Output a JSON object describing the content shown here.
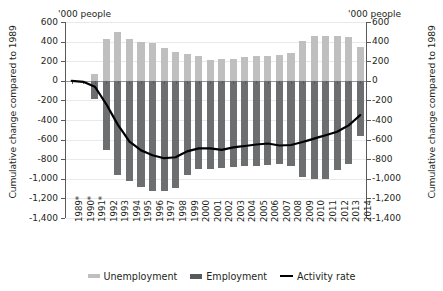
{
  "axes": {
    "ylabel_left": "Cumulative change compared to 1989",
    "ylabel_right": "Cumulative change compared to 1989",
    "units_left": "'000 people",
    "units_right": "'000 people"
  },
  "legend": {
    "items": [
      {
        "label": "Unemployment",
        "color": "#bfbfbf",
        "marker": "swatch-unemployment"
      },
      {
        "label": "Employment",
        "color": "#58595b",
        "marker": "swatch-employment"
      },
      {
        "label": "Activity rate",
        "color": "#000000",
        "marker": "swatch-activity-line"
      }
    ]
  },
  "chart_data": {
    "type": "bar",
    "title": "",
    "subtitle": "",
    "xlabel": "",
    "ylabel": "Cumulative change compared to 1989",
    "units": "'000 people",
    "ylim": [
      -1400,
      600
    ],
    "ytick_labels": [
      "600",
      "400",
      "200",
      "0",
      "-200",
      "-400",
      "-600",
      "-800",
      "-1,000",
      "-1,200",
      "-1,400"
    ],
    "ytick_values": [
      600,
      400,
      200,
      0,
      -200,
      -400,
      -600,
      -800,
      -1000,
      -1200,
      -1400
    ],
    "grid": true,
    "legend_position": "bottom",
    "dual_axis": true,
    "categories": [
      "1989*",
      "1990*",
      "1991*",
      "1992",
      "1993",
      "1994",
      "1995",
      "1996",
      "1997",
      "1998",
      "1999",
      "2000",
      "2001",
      "2002",
      "2003",
      "2004",
      "2005",
      "2006",
      "2007",
      "2008",
      "2009",
      "2010",
      "2011",
      "2012",
      "2013",
      "2014"
    ],
    "series": [
      {
        "name": "Unemployment",
        "color": "#bfbfbf",
        "type": "bar",
        "values": [
          0,
          0,
          70,
          425,
          500,
          430,
          395,
          385,
          330,
          295,
          275,
          250,
          215,
          220,
          225,
          240,
          255,
          250,
          265,
          280,
          405,
          460,
          460,
          460,
          445,
          340
        ]
      },
      {
        "name": "Employment",
        "color": "#58595b",
        "type": "bar",
        "values": [
          0,
          0,
          -190,
          -710,
          -960,
          -1020,
          -1085,
          -1120,
          -1120,
          -1095,
          -960,
          -905,
          -900,
          -890,
          -880,
          -870,
          -865,
          -855,
          -845,
          -870,
          -985,
          -1005,
          -1000,
          -915,
          -845,
          -560
        ]
      },
      {
        "name": "Activity rate",
        "color": "#000000",
        "type": "line",
        "values": [
          0,
          -10,
          -60,
          -240,
          -450,
          -620,
          -710,
          -760,
          -790,
          -780,
          -720,
          -690,
          -690,
          -705,
          -680,
          -665,
          -650,
          -640,
          -660,
          -655,
          -625,
          -590,
          -555,
          -520,
          -455,
          -350
        ]
      }
    ]
  }
}
